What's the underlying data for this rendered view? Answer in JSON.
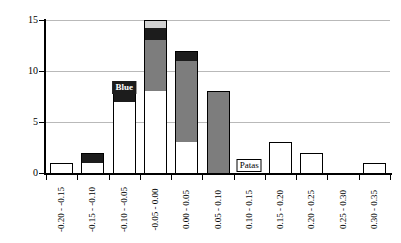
{
  "chart_data": {
    "type": "bar",
    "title": "",
    "subtitle": "",
    "xlabel": "",
    "ylabel": "",
    "stacked": true,
    "grid": true,
    "legend_position": "none",
    "ylim": [
      0,
      15
    ],
    "yticks": [
      "0",
      "5",
      "10",
      "15"
    ],
    "ytick_values": [
      0,
      5,
      10,
      15
    ],
    "categories": [
      "-0.20 - -0.15",
      "-0.15 - -0.10",
      "-0.10 - -0.05",
      "-0.05 - 0.00",
      "0.00 - 0.05",
      "0.05 - 0.10",
      "0.10 - 0.15",
      "0.15 - 0.20",
      "0.20 - 0.25",
      "0.25 - 0.30",
      "0.30 - 0.35"
    ],
    "series": [
      {
        "name": "white",
        "color": "#ffffff",
        "values": [
          1,
          1,
          7,
          8,
          3,
          0,
          0,
          3,
          2,
          0,
          1
        ]
      },
      {
        "name": "gray",
        "color": "#7d7d7d",
        "values": [
          0,
          0,
          0,
          5,
          8,
          8,
          0,
          0,
          0,
          0,
          0
        ]
      },
      {
        "name": "black",
        "color": "#1c1c1c",
        "values": [
          0,
          1,
          2,
          1.2,
          1,
          0,
          0,
          0,
          0,
          0,
          0
        ]
      },
      {
        "name": "light-gray",
        "color": "#d2d2d2",
        "values": [
          0,
          0,
          0,
          0.8,
          0,
          0,
          0,
          0,
          0,
          0,
          0
        ]
      }
    ],
    "totals": [
      1,
      2,
      9,
      15,
      12,
      8,
      0,
      3,
      2,
      0,
      1
    ],
    "annotations": [
      {
        "text": "Blue",
        "category": "-0.10 - -0.05",
        "style": "on-dark"
      },
      {
        "text": "Patas",
        "category": "0.10 - 0.15",
        "style": "on-light"
      }
    ]
  }
}
